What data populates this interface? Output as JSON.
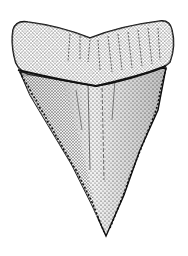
{
  "image": {
    "subject": "shark tooth illustration",
    "style": "stippled ink drawing",
    "background_color": "#ffffff",
    "ink_color": "#111111"
  }
}
